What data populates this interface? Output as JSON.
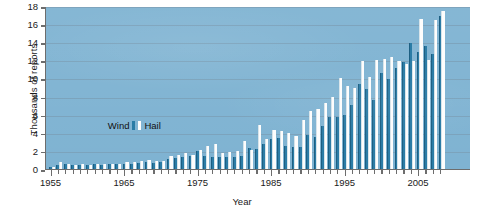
{
  "chart_data": {
    "type": "bar",
    "title": "",
    "subtitle": "",
    "xlabel": "Year",
    "ylabel": "Thousands of reports",
    "ylim": [
      0,
      18
    ],
    "ytick_values": [
      0,
      2,
      4,
      6,
      8,
      10,
      12,
      14,
      16,
      18
    ],
    "ytick_labels": [
      "0",
      "2",
      "4",
      "6",
      "8",
      "10",
      "12",
      "14",
      "16",
      "18"
    ],
    "xlim": [
      1954.3,
      1910.0
    ],
    "xtick_labels": [
      "1955",
      "1965",
      "1975",
      "1985",
      "1995",
      "2005"
    ],
    "xtick_values": [
      1955,
      1965,
      1975,
      1985,
      1995,
      2005
    ],
    "grid": true,
    "grid_axis": "y",
    "legend_position": "inside-upper-left",
    "categories": [
      1955,
      1956,
      1957,
      1958,
      1959,
      1960,
      1961,
      1962,
      1963,
      1964,
      1965,
      1966,
      1967,
      1968,
      1969,
      1970,
      1971,
      1972,
      1973,
      1974,
      1975,
      1976,
      1977,
      1978,
      1979,
      1980,
      1981,
      1982,
      1983,
      1984,
      1985,
      1986,
      1987,
      1988,
      1989,
      1990,
      1991,
      1992,
      1993,
      1994,
      1995,
      1996,
      1997,
      1998,
      1999,
      2000,
      2001,
      2002,
      2003,
      2004,
      2005,
      2006,
      2007,
      2008
    ],
    "series": [
      {
        "name": "Wind",
        "color": "#2b7ca6",
        "values": [
          0.25,
          0.45,
          0.55,
          0.4,
          0.45,
          0.4,
          0.5,
          0.45,
          0.5,
          0.55,
          0.6,
          0.6,
          0.7,
          0.75,
          0.7,
          0.8,
          1.1,
          1.25,
          1.35,
          1.4,
          1.95,
          1.45,
          1.35,
          1.3,
          1.35,
          1.35,
          1.45,
          2.35,
          2.25,
          2.75,
          3.35,
          3.4,
          2.5,
          2.4,
          2.45,
          3.8,
          3.55,
          4.7,
          5.7,
          5.75,
          6.0,
          7.1,
          9.35,
          8.85,
          7.6,
          10.65,
          9.95,
          11.2,
          11.85,
          13.9,
          12.9,
          13.6,
          12.7,
          16.95
        ]
      },
      {
        "name": "Hail",
        "color": "#fdfdfd",
        "values": [
          0.2,
          0.75,
          0.55,
          0.45,
          0.5,
          0.45,
          0.55,
          0.5,
          0.55,
          0.6,
          0.75,
          0.8,
          0.85,
          0.95,
          0.85,
          0.9,
          1.45,
          1.6,
          1.75,
          1.6,
          2.15,
          2.5,
          2.8,
          1.8,
          1.9,
          2.0,
          3.1,
          2.15,
          4.85,
          3.3,
          4.3,
          4.2,
          3.95,
          3.65,
          5.45,
          6.45,
          6.6,
          7.25,
          7.9,
          10.0,
          9.2,
          8.9,
          11.9,
          10.15,
          12.05,
          12.1,
          12.4,
          11.9,
          11.55,
          11.9,
          16.55,
          12.05,
          16.5,
          17.5
        ]
      }
    ],
    "legend": [
      {
        "label": "Wind",
        "color": "#2b7ca6"
      },
      {
        "label": "Hail",
        "color": "#fdfdfd"
      }
    ],
    "plot_background": "#7fb3d2",
    "axis_color": "#6d6d6d"
  }
}
